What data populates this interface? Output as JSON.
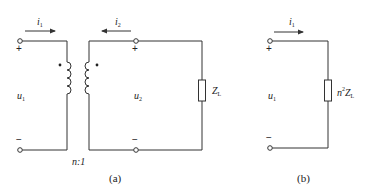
{
  "figure_a": {
    "caption": "(a)",
    "current_in": {
      "symbol": "i",
      "sub": "1",
      "direction": "right"
    },
    "current_out": {
      "symbol": "i",
      "sub": "2",
      "direction": "left"
    },
    "voltage_primary": {
      "symbol": "u",
      "sub": "1"
    },
    "voltage_secondary": {
      "symbol": "u",
      "sub": "2"
    },
    "polarity_plus_primary": "+",
    "polarity_minus_primary": "−",
    "polarity_plus_secondary": "+",
    "polarity_minus_secondary": "−",
    "turns_ratio": "n:1",
    "load": {
      "symbol": "Z",
      "sub": "L"
    }
  },
  "figure_b": {
    "caption": "(b)",
    "current_in": {
      "symbol": "i",
      "sub": "1",
      "direction": "right"
    },
    "voltage": {
      "symbol": "u",
      "sub": "1"
    },
    "polarity_plus": "+",
    "polarity_minus": "−",
    "load": {
      "prefix": "n",
      "sup": "2",
      "symbol": "Z",
      "sub": "L"
    }
  },
  "colors": {
    "stroke": "#333333",
    "background": "#ffffff"
  }
}
